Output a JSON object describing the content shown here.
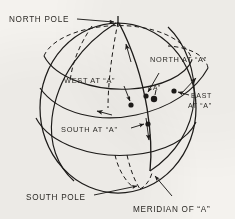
{
  "figure": {
    "type": "line-diagram",
    "background_color": "#f4f2ee",
    "ink_color": "#1d1b19"
  },
  "labels": {
    "north_pole": "NORTH POLE",
    "south_pole": "SOUTH POLE",
    "north_at_a": "NORTH AT “A”",
    "south_at_a": "SOUTH AT “A”",
    "east_at_a_line1": "EAST",
    "east_at_a_line2": "AT “A”",
    "west_at_a": "WEST AT “A”",
    "point_a": "“A”",
    "meridian_of_a": "MERIDIAN OF “A”"
  },
  "elements": {
    "sphere_outline": "sphere-outline",
    "upper_latitude_circle": "upper-latitude-circle",
    "lower_latitude_circle": "lower-latitude-circle",
    "horizon_great_circle": "horizon-great-circle",
    "meridian_arc": "meridian-arc",
    "hidden_meridian_dashed": "hidden-meridian-dashed",
    "polar_axis_dashed": "polar-axis-dashed"
  },
  "markers": {
    "point_a": "point-a-marker",
    "north_point": "north-direction-marker",
    "south_point": "south-direction-marker",
    "east_point": "east-direction-marker",
    "west_point": "west-direction-marker"
  }
}
